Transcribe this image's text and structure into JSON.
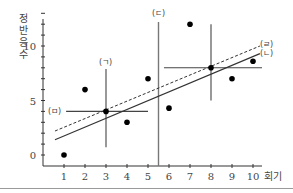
{
  "chart_data": {
    "type": "scatter",
    "title": "",
    "xlabel": "회기",
    "ylabel": "정반응수",
    "xlim": [
      0,
      10.5
    ],
    "ylim": [
      0,
      13
    ],
    "x_ticks": [
      1,
      2,
      3,
      4,
      5,
      6,
      7,
      8,
      9,
      10
    ],
    "y_tick_labels": [
      0,
      5,
      10
    ],
    "y_minor_ticks": [
      0,
      1,
      2,
      3,
      4,
      5,
      6,
      7,
      8,
      9,
      10,
      11,
      12,
      13
    ],
    "grid": false,
    "points": [
      {
        "x": 1,
        "y": 0
      },
      {
        "x": 2,
        "y": 6
      },
      {
        "x": 3,
        "y": 4
      },
      {
        "x": 4,
        "y": 3
      },
      {
        "x": 5,
        "y": 7
      },
      {
        "x": 6,
        "y": 4.3
      },
      {
        "x": 7,
        "y": 12
      },
      {
        "x": 8,
        "y": 8
      },
      {
        "x": 9,
        "y": 7
      },
      {
        "x": 10,
        "y": 8.6
      }
    ],
    "lines": [
      {
        "label": "(ㄴ)",
        "style": "solid",
        "x1": 0.57,
        "y1": 1.4,
        "x2": 10.33,
        "y2": 9.3
      },
      {
        "label": "(ㄹ)",
        "style": "dashed",
        "x1": 0.57,
        "y1": 2.2,
        "x2": 10.33,
        "y2": 10.0
      }
    ],
    "annotations": [
      {
        "label": "(ㄱ)",
        "type": "vertical",
        "x": 3,
        "y1": 0.7,
        "y2": 7.9,
        "desc": "range at session 3"
      },
      {
        "label": "(ㅁ)",
        "type": "horizontal",
        "y": 4,
        "x1": 1.1,
        "x2": 5.0,
        "desc": "mean level"
      },
      {
        "label": "(ㄷ)",
        "type": "vertical",
        "x": 5.5,
        "y1": 0,
        "y2": 12.2,
        "desc": "phase change line"
      },
      {
        "label": "",
        "type": "horizontal",
        "y": 8,
        "x1": 5.76,
        "x2": 10.43
      },
      {
        "label": "",
        "type": "vertical",
        "x": 8,
        "y1": 5,
        "y2": 12
      }
    ]
  },
  "labels": {
    "y_axis_chars": [
      "정",
      "반",
      "응",
      "수"
    ],
    "x_axis_label": "회기",
    "ann_g": "(ㄱ)",
    "ann_n": "(ㄴ)",
    "ann_d": "(ㄷ)",
    "ann_r": "(ㄹ)",
    "ann_m": "(ㅁ)"
  }
}
